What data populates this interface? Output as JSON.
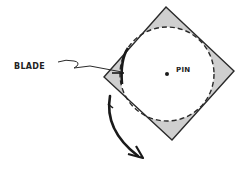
{
  "diagram": {
    "labels": {
      "blade": "BLADE",
      "pin": "PIN"
    },
    "colors": {
      "line": "#2a2a2a",
      "fill": "#cfcfcf",
      "background": "#ffffff"
    },
    "shapes": {
      "diamond": "rotated square outline with shaded corners",
      "circle": "dashed circle inscribed in diamond",
      "pin": "center dot",
      "arrow": "curved rotation arrow (clockwise, downward)"
    }
  }
}
